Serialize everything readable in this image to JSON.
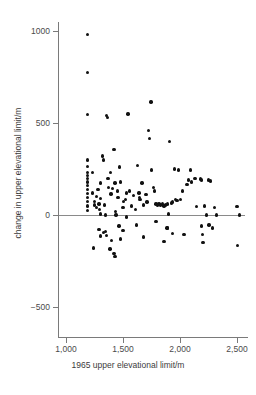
{
  "chart_data": {
    "type": "scatter",
    "title": "",
    "xlabel": "1965 upper elevational limit/m",
    "ylabel": "change in upper elevational limit/m",
    "xlim": [
      900,
      2600
    ],
    "ylim": [
      -620,
      1060
    ],
    "xticks": [
      1000,
      1500,
      2000,
      2500
    ],
    "xticklabels": [
      "1,000",
      "1,500",
      "2,000",
      "2,500"
    ],
    "yticks": [
      1000,
      500,
      0,
      -500
    ],
    "yticklabels": [
      "1000",
      "500",
      "0",
      "−500"
    ],
    "grid": false,
    "legend": null,
    "reference_line": {
      "axis": "y",
      "value": 0
    },
    "marker": {
      "shape": "circle",
      "color": "#111111",
      "size": 3.4
    },
    "n_points": 112,
    "points": [
      [
        1190,
        980
      ],
      [
        1190,
        775
      ],
      [
        1190,
        545
      ],
      [
        1190,
        300
      ],
      [
        1190,
        265
      ],
      [
        1190,
        232
      ],
      [
        1190,
        215
      ],
      [
        1190,
        198
      ],
      [
        1190,
        180
      ],
      [
        1190,
        160
      ],
      [
        1190,
        140
      ],
      [
        1190,
        118
      ],
      [
        1190,
        95
      ],
      [
        1190,
        72
      ],
      [
        1190,
        48
      ],
      [
        1190,
        25
      ],
      [
        1230,
        230
      ],
      [
        1230,
        120
      ],
      [
        1250,
        75
      ],
      [
        1250,
        55
      ],
      [
        1265,
        40
      ],
      [
        1270,
        100
      ],
      [
        1280,
        140
      ],
      [
        1290,
        60
      ],
      [
        1295,
        30
      ],
      [
        1300,
        175
      ],
      [
        1300,
        90
      ],
      [
        1305,
        5
      ],
      [
        1320,
        320
      ],
      [
        1330,
        300
      ],
      [
        1340,
        55
      ],
      [
        1345,
        0
      ],
      [
        1355,
        540
      ],
      [
        1365,
        530
      ],
      [
        1370,
        200
      ],
      [
        1375,
        150
      ],
      [
        1390,
        230
      ],
      [
        1395,
        115
      ],
      [
        1410,
        145
      ],
      [
        1420,
        355
      ],
      [
        1430,
        175
      ],
      [
        1435,
        20
      ],
      [
        1440,
        0
      ],
      [
        1450,
        130
      ],
      [
        1455,
        95
      ],
      [
        1470,
        260
      ],
      [
        1480,
        180
      ],
      [
        1500,
        40
      ],
      [
        1505,
        75
      ],
      [
        1520,
        85
      ],
      [
        1530,
        120
      ],
      [
        1545,
        550
      ],
      [
        1555,
        130
      ],
      [
        1575,
        50
      ],
      [
        1590,
        105
      ],
      [
        1610,
        30
      ],
      [
        1625,
        270
      ],
      [
        1640,
        120
      ],
      [
        1645,
        95
      ],
      [
        1650,
        85
      ],
      [
        1665,
        175
      ],
      [
        1680,
        55
      ],
      [
        1700,
        110
      ],
      [
        1710,
        70
      ],
      [
        1725,
        460
      ],
      [
        1730,
        415
      ],
      [
        1745,
        615
      ],
      [
        1750,
        245
      ],
      [
        1765,
        150
      ],
      [
        1775,
        130
      ],
      [
        1790,
        60
      ],
      [
        1800,
        55
      ],
      [
        1815,
        60
      ],
      [
        1830,
        55
      ],
      [
        1845,
        60
      ],
      [
        1860,
        50
      ],
      [
        1875,
        55
      ],
      [
        1890,
        60
      ],
      [
        1900,
        5
      ],
      [
        1910,
        400
      ],
      [
        1925,
        65
      ],
      [
        1935,
        70
      ],
      [
        1950,
        250
      ],
      [
        1960,
        85
      ],
      [
        1975,
        80
      ],
      [
        1985,
        245
      ],
      [
        2005,
        85
      ],
      [
        2020,
        130
      ],
      [
        2060,
        165
      ],
      [
        2075,
        190
      ],
      [
        2090,
        245
      ],
      [
        2100,
        180
      ],
      [
        2130,
        200
      ],
      [
        2145,
        45
      ],
      [
        2180,
        195
      ],
      [
        2190,
        190
      ],
      [
        2215,
        50
      ],
      [
        2230,
        0
      ],
      [
        2250,
        190
      ],
      [
        2265,
        185
      ],
      [
        2300,
        40
      ],
      [
        2320,
        0
      ],
      [
        2500,
        45
      ],
      [
        2520,
        0
      ],
      [
        1240,
        -180
      ],
      [
        1290,
        -80
      ],
      [
        1300,
        -115
      ],
      [
        1330,
        -95
      ],
      [
        1345,
        -90
      ],
      [
        1355,
        -110
      ],
      [
        1385,
        -185
      ],
      [
        1400,
        -140
      ],
      [
        1420,
        -210
      ],
      [
        1430,
        -225
      ],
      [
        1465,
        -60
      ],
      [
        1480,
        -130
      ],
      [
        1500,
        -85
      ],
      [
        1530,
        -10
      ],
      [
        1620,
        -55
      ],
      [
        1680,
        -120
      ],
      [
        1790,
        -35
      ],
      [
        1860,
        -145
      ],
      [
        1885,
        -70
      ],
      [
        1890,
        -70
      ],
      [
        1935,
        -100
      ],
      [
        2035,
        -105
      ],
      [
        2190,
        -60
      ],
      [
        2195,
        -105
      ],
      [
        2200,
        -150
      ],
      [
        2255,
        -55
      ],
      [
        2285,
        -70
      ],
      [
        2505,
        -165
      ]
    ]
  }
}
